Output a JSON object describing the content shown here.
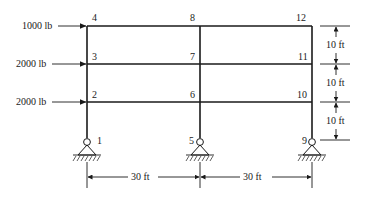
{
  "diagram": {
    "type": "portal frame structure",
    "loads": [
      {
        "node": "4",
        "label": "1000 lb"
      },
      {
        "node": "3",
        "label": "2000 lb"
      },
      {
        "node": "2",
        "label": "2000 lb"
      }
    ],
    "nodes": [
      "1",
      "2",
      "3",
      "4",
      "5",
      "6",
      "7",
      "8",
      "9",
      "10",
      "11",
      "12"
    ],
    "story_heights": [
      "10 ft",
      "10 ft",
      "10 ft"
    ],
    "bay_widths": [
      "30 ft",
      "30 ft"
    ],
    "supports": [
      "pin",
      "pin",
      "pin"
    ],
    "colors": {
      "ink": "#1a1a1a",
      "background": "#ffffff"
    }
  }
}
